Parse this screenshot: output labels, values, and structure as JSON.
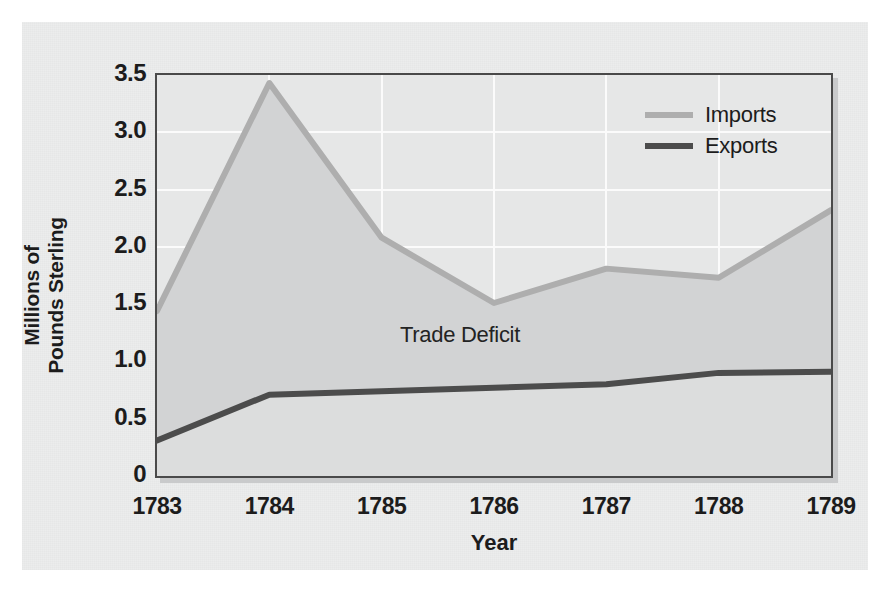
{
  "chart_data": {
    "type": "line",
    "title": "",
    "xlabel": "Year",
    "ylabel": "Millions of Pounds Sterling",
    "ylabel_line1": "Millions of",
    "ylabel_line2": "Pounds Sterling",
    "categories": [
      "1783",
      "1784",
      "1785",
      "1786",
      "1787",
      "1788",
      "1789"
    ],
    "x": [
      1783,
      1784,
      1785,
      1786,
      1787,
      1788,
      1789
    ],
    "series": [
      {
        "name": "Imports",
        "color": "#aeaeae",
        "values": [
          1.44,
          3.43,
          2.08,
          1.51,
          1.81,
          1.73,
          2.32
        ]
      },
      {
        "name": "Exports",
        "color": "#4c4c4c",
        "values": [
          0.31,
          0.71,
          0.74,
          0.77,
          0.8,
          0.9,
          0.91
        ]
      }
    ],
    "ylim": [
      0,
      3.5
    ],
    "yticks": [
      0,
      0.5,
      1.0,
      1.5,
      2.0,
      2.5,
      3.0,
      3.5
    ],
    "ytick_labels": [
      "0",
      "0.5",
      "1.0",
      "1.5",
      "2.0",
      "2.5",
      "3.0",
      "3.5"
    ],
    "xlim": [
      1783,
      1789
    ],
    "grid": true,
    "grid_color": "#fbfbfb",
    "legend_position": "top-right-inside",
    "annotations": [
      {
        "text": "Trade Deficit",
        "x": 1785.6,
        "y": 1.28,
        "describes": "shaded band between Imports and Exports curves"
      }
    ],
    "fill_between": {
      "upper": "Imports",
      "lower": "Exports",
      "label": "Trade Deficit",
      "color": "#d2d3d4"
    },
    "plot_background": "#e6e7e7",
    "page_background": "#eceded",
    "frame_color": "#4a4a4a"
  },
  "legend": {
    "items": [
      {
        "label": "Imports",
        "color": "#aeaeae"
      },
      {
        "label": "Exports",
        "color": "#4c4c4c"
      }
    ]
  },
  "annotation": {
    "trade_deficit": "Trade Deficit"
  },
  "axes": {
    "y_title_line1": "Millions of",
    "y_title_line2": "Pounds Sterling",
    "x_title": "Year",
    "y_ticks": [
      "3.5",
      "3.0",
      "2.5",
      "2.0",
      "1.5",
      "1.0",
      "0.5",
      "0"
    ],
    "x_ticks": [
      "1783",
      "1784",
      "1785",
      "1786",
      "1787",
      "1788",
      "1789"
    ]
  }
}
